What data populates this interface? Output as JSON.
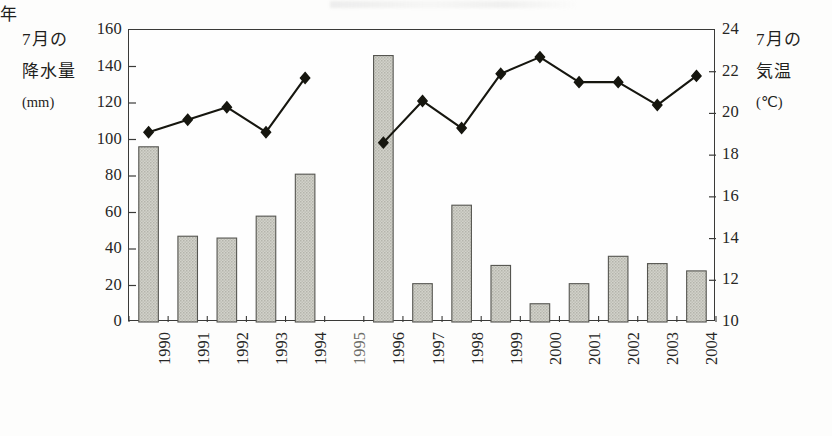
{
  "chart_data": {
    "type": "bar",
    "title": "",
    "subtitle": "",
    "xlabel": "年",
    "categories": [
      "1990",
      "1991",
      "1992",
      "1993",
      "1994",
      "1995",
      "1996",
      "1997",
      "1998",
      "1999",
      "2000",
      "2001",
      "2002",
      "2003",
      "2004"
    ],
    "grid": false,
    "legend_position": "none",
    "axes": {
      "left": {
        "label_lines": [
          "7月の",
          "降水量",
          "(mm)"
        ],
        "unit": "mm",
        "ylim": [
          0,
          160
        ],
        "tick_step": 20,
        "ticks": [
          0,
          20,
          40,
          60,
          80,
          100,
          120,
          140,
          160
        ]
      },
      "right": {
        "label_lines": [
          "7月の",
          "気温",
          "(℃)"
        ],
        "unit": "℃",
        "ylim": [
          10,
          24
        ],
        "tick_step": 2,
        "ticks": [
          10,
          12,
          14,
          16,
          18,
          20,
          22,
          24
        ]
      }
    },
    "series": [
      {
        "name": "7月の降水量",
        "type": "bar",
        "axis": "left",
        "unit": "mm",
        "color": "#c9c9c2",
        "edge_color": "#555550",
        "values": [
          96,
          47,
          46,
          58,
          81,
          null,
          146,
          21,
          64,
          31,
          10,
          21,
          36,
          32,
          28
        ]
      },
      {
        "name": "7月の気温",
        "type": "line",
        "axis": "right",
        "unit": "℃",
        "color": "#16160f",
        "marker": "diamond",
        "values": [
          19.1,
          19.7,
          20.3,
          19.1,
          21.7,
          null,
          18.6,
          20.6,
          19.3,
          21.9,
          22.7,
          21.5,
          21.5,
          20.4,
          21.8
        ]
      }
    ],
    "notes": {
      "missing_year": "1995",
      "missing_note": "1995年はデータなし（棒・折れ線ともに欠測）"
    }
  }
}
